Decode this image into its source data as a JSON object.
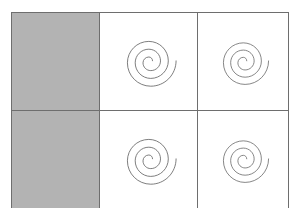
{
  "figure": {
    "canvas_width": 299,
    "canvas_height": 208,
    "background_color": "#ffffff"
  },
  "grid": {
    "rows": 3,
    "columns": 3,
    "origin_x": 11,
    "origin_y": 12,
    "width": 274,
    "height": 183,
    "column_widths": [
      87,
      97,
      90
    ],
    "row_heights": [
      63,
      62,
      58
    ],
    "border_color": "#6e6e6e",
    "border_width": 1,
    "outer_border_color": "#5a5a5a"
  },
  "palette": {
    "shaded_fill": "#b3b3b3",
    "empty_fill": "#ffffff",
    "spiral_stroke": "#6b6b6b",
    "grid_line": "#6e6e6e"
  },
  "spiral": {
    "name": "archimedean-spiral",
    "turns": 2.25,
    "direction": "counterclockwise-outward",
    "tail_exit": "lower-right",
    "stroke_color": "#6b6b6b",
    "stroke_width": 0.9,
    "viewbox": "0 0 100 100",
    "path": "M 54.20 49.22 C 54.20 47.09 52.47 45.36 50.34 45.36 C 47.02 45.36 44.33 48.05 44.33 51.37 C 44.33 55.80 47.92 59.39 52.35 59.39 C 57.89 59.39 62.38 54.90 62.38 49.36 C 62.38 42.71 56.99 37.32 50.34 37.32 C 42.58 37.32 36.29 43.61 36.29 51.37 C 36.29 60.24 43.48 67.43 52.35 67.43 C 62.33 67.43 70.42 59.34 70.42 49.36 C 70.42 38.27 61.43 29.28 50.34 29.28 C 38.15 29.28 28.26 39.17 28.26 51.37 C 28.26 64.67 39.04 75.46 52.35 75.46 C 66.76 75.46 78.45 63.77 78.45 49.36"
  },
  "cells": [
    {
      "row": 1,
      "column": 1,
      "name": "cell-r1c1",
      "fill": "shaded",
      "content": "none",
      "label": "shaded cell"
    },
    {
      "row": 1,
      "column": 2,
      "name": "cell-r1c2",
      "fill": "empty",
      "content": "spiral",
      "label": "spiral cell"
    },
    {
      "row": 1,
      "column": 3,
      "name": "cell-r1c3",
      "fill": "empty",
      "content": "spiral",
      "label": "spiral cell"
    },
    {
      "row": 2,
      "column": 1,
      "name": "cell-r2c1",
      "fill": "shaded",
      "content": "none",
      "label": "shaded cell"
    },
    {
      "row": 2,
      "column": 2,
      "name": "cell-r2c2",
      "fill": "empty",
      "content": "spiral",
      "label": "spiral cell"
    },
    {
      "row": 2,
      "column": 3,
      "name": "cell-r2c3",
      "fill": "empty",
      "content": "spiral",
      "label": "spiral cell"
    },
    {
      "row": 3,
      "column": 1,
      "name": "cell-r3c1",
      "fill": "empty",
      "content": "none",
      "label": "empty cell"
    },
    {
      "row": 3,
      "column": 2,
      "name": "cell-r3c2",
      "fill": "empty",
      "content": "none",
      "label": "empty cell"
    },
    {
      "row": 3,
      "column": 3,
      "name": "cell-r3c3",
      "fill": "empty",
      "content": "none",
      "label": "empty cell"
    }
  ],
  "counts": {
    "shaded_cells": 2,
    "spiral_cells": 4,
    "empty_cells": 3,
    "total_cells": 9
  }
}
